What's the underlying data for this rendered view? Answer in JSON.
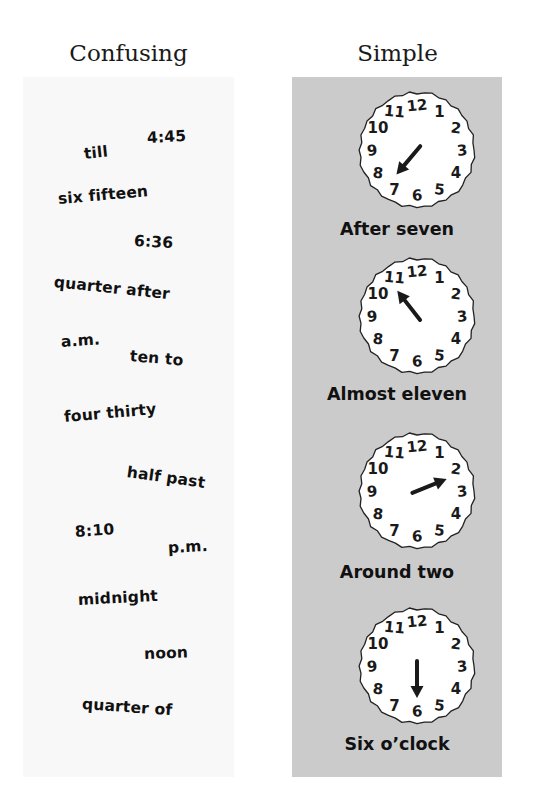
{
  "headers": {
    "left": "Confusing",
    "right": "Simple"
  },
  "colors": {
    "left_panel": "#f8f8f8",
    "right_panel": "#cbcbcb",
    "clock_face": "#ffffff",
    "ink": "#111111"
  },
  "confusing_words": [
    {
      "text": "4:45",
      "x": 124,
      "y": 52,
      "rot": -3
    },
    {
      "text": "till",
      "x": 61,
      "y": 68,
      "rot": -6
    },
    {
      "text": "six fifteen",
      "x": 35,
      "y": 113,
      "rot": -5
    },
    {
      "text": "6:36",
      "x": 111,
      "y": 155,
      "rot": 3
    },
    {
      "text": "quarter after",
      "x": 31,
      "y": 196,
      "rot": 6
    },
    {
      "text": "a.m.",
      "x": 38,
      "y": 256,
      "rot": -4
    },
    {
      "text": "ten to",
      "x": 107,
      "y": 270,
      "rot": 5
    },
    {
      "text": "four thirty",
      "x": 41,
      "y": 331,
      "rot": -5
    },
    {
      "text": "half past",
      "x": 104,
      "y": 386,
      "rot": 8
    },
    {
      "text": "8:10",
      "x": 52,
      "y": 446,
      "rot": -4
    },
    {
      "text": "p.m.",
      "x": 145,
      "y": 462,
      "rot": -3
    },
    {
      "text": "midnight",
      "x": 55,
      "y": 514,
      "rot": -3
    },
    {
      "text": "noon",
      "x": 121,
      "y": 568,
      "rot": -2
    },
    {
      "text": "quarter of",
      "x": 59,
      "y": 618,
      "rot": 4
    }
  ],
  "clocks": [
    {
      "label": "After seven",
      "hand_angle": 220,
      "top": 8,
      "label_top": 142
    },
    {
      "label": "Almost eleven",
      "hand_angle": 322,
      "top": 174,
      "label_top": 307
    },
    {
      "label": "Around two",
      "hand_angle": 68,
      "top": 349,
      "label_top": 485
    },
    {
      "label": "Six o’clock",
      "hand_angle": 180,
      "top": 524,
      "label_top": 657
    }
  ],
  "clock_numbers": [
    "12",
    "1",
    "2",
    "3",
    "4",
    "5",
    "6",
    "7",
    "8",
    "9",
    "10",
    "11"
  ]
}
